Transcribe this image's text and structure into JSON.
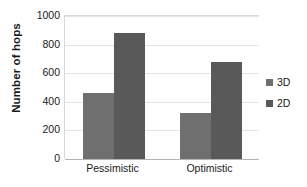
{
  "chart_data": {
    "type": "bar",
    "title": "",
    "xlabel": "",
    "ylabel": "Number of hops",
    "categories": [
      "Pessimistic",
      "Optimistic"
    ],
    "series": [
      {
        "name": "3D",
        "values": [
          460,
          320
        ],
        "color": "#6f6f6f"
      },
      {
        "name": "2D",
        "values": [
          880,
          680
        ],
        "color": "#595959"
      }
    ],
    "ylim": [
      0,
      1000
    ],
    "yticks": [
      0,
      200,
      400,
      600,
      800,
      1000
    ],
    "ytick_labels": [
      "0",
      "200",
      "400",
      "600",
      "800",
      "1000"
    ],
    "grid": "horizontal",
    "legend_position": "right",
    "legend_entries": [
      "3D",
      "2D"
    ]
  },
  "axes": {
    "y_title": "Number of hops"
  }
}
